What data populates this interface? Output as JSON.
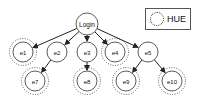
{
  "diagram": {
    "root": {
      "id": "login",
      "label": "Login",
      "x": 87,
      "y": 24
    },
    "nodes": [
      {
        "id": "e1",
        "label": "e1",
        "x": 23,
        "y": 52,
        "hue": true
      },
      {
        "id": "e2",
        "label": "e2",
        "x": 57,
        "y": 52,
        "hue": false
      },
      {
        "id": "e3",
        "label": "e3",
        "x": 87,
        "y": 52,
        "hue": false
      },
      {
        "id": "e4",
        "label": "e4",
        "x": 115,
        "y": 52,
        "hue": true
      },
      {
        "id": "e5",
        "label": "e5",
        "x": 148,
        "y": 52,
        "hue": false
      },
      {
        "id": "e7",
        "label": "e7",
        "x": 35,
        "y": 81,
        "hue": true
      },
      {
        "id": "e8",
        "label": "e8",
        "x": 87,
        "y": 81,
        "hue": true
      },
      {
        "id": "e9",
        "label": "e9",
        "x": 126,
        "y": 81,
        "hue": true
      },
      {
        "id": "e10",
        "label": "e10",
        "x": 172,
        "y": 81,
        "hue": true
      }
    ],
    "edges": [
      {
        "from": "login",
        "to": "e1"
      },
      {
        "from": "login",
        "to": "e2"
      },
      {
        "from": "login",
        "to": "e3"
      },
      {
        "from": "login",
        "to": "e4"
      },
      {
        "from": "login",
        "to": "e5"
      },
      {
        "from": "e2",
        "to": "e7"
      },
      {
        "from": "e3",
        "to": "e8"
      },
      {
        "from": "e5",
        "to": "e9"
      },
      {
        "from": "e5",
        "to": "e10"
      }
    ]
  },
  "legend": {
    "label": "HUE"
  }
}
